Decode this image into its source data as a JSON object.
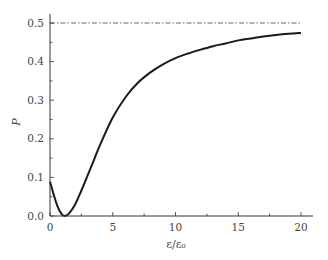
{
  "chart_data": {
    "type": "line",
    "title": "",
    "xlabel": "ε/ε₀",
    "ylabel": "P",
    "xlim": [
      0,
      20
    ],
    "ylim": [
      0,
      0.5
    ],
    "x_ticks": [
      "0",
      "5",
      "10",
      "15",
      "20"
    ],
    "y_ticks": [
      "0.0",
      "0.1",
      "0.2",
      "0.3",
      "0.4",
      "0.5"
    ],
    "grid": false,
    "legend": null,
    "series": [
      {
        "name": "P",
        "style": "solid",
        "color": "#1a1a1a",
        "x": [
          0,
          0.3,
          0.6,
          0.9,
          1.15,
          1.5,
          2.0,
          2.5,
          3.0,
          3.5,
          4.0,
          5.0,
          6.0,
          7.0,
          8.0,
          9.0,
          10.0,
          11.0,
          12.0,
          13.0,
          14.0,
          15.0,
          16.0,
          17.0,
          18.0,
          19.0,
          20.0
        ],
        "y": [
          0.089,
          0.055,
          0.025,
          0.006,
          0.0,
          0.006,
          0.03,
          0.066,
          0.105,
          0.145,
          0.185,
          0.255,
          0.307,
          0.345,
          0.372,
          0.393,
          0.409,
          0.421,
          0.431,
          0.44,
          0.447,
          0.455,
          0.46,
          0.465,
          0.469,
          0.472,
          0.474
        ]
      },
      {
        "name": "asymptote",
        "style": "dash-dot",
        "color": "#555555",
        "x": [
          0,
          20
        ],
        "y": [
          0.5,
          0.5
        ]
      }
    ]
  }
}
